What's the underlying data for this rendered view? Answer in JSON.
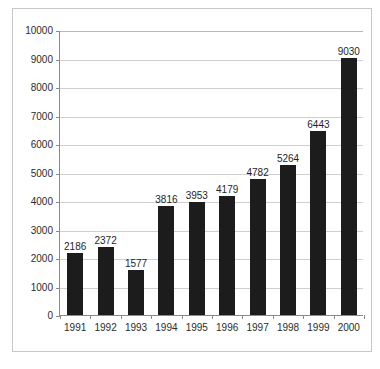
{
  "chart_data": {
    "type": "bar",
    "title": "",
    "subtitle": "",
    "xlabel": "",
    "ylabel": "",
    "categories": [
      "1991",
      "1992",
      "1993",
      "1994",
      "1995",
      "1996",
      "1997",
      "1998",
      "1999",
      "2000"
    ],
    "values": [
      2186,
      2372,
      1577,
      3816,
      3953,
      4179,
      4782,
      5264,
      6443,
      9030
    ],
    "data_labels": [
      "2186",
      "2372",
      "1577",
      "3816",
      "3953",
      "4179",
      "4782",
      "5264",
      "6443",
      "9030"
    ],
    "ylim": [
      0,
      10000
    ],
    "ytick_values": [
      0,
      1000,
      2000,
      3000,
      4000,
      5000,
      6000,
      7000,
      8000,
      9000,
      10000
    ],
    "ytick_labels": [
      "0",
      "1000",
      "2000",
      "3000",
      "4000",
      "5000",
      "6000",
      "7000",
      "8000",
      "9000",
      "10000"
    ],
    "grid": true,
    "grid_axis": "y",
    "legend": false,
    "legend_position": "none",
    "series": [
      {
        "name": "",
        "values": [
          2186,
          2372,
          1577,
          3816,
          3953,
          4179,
          4782,
          5264,
          6443,
          9030
        ]
      }
    ],
    "colors": {
      "bar": "#1c1c1c",
      "gridline": "#cfcfcf",
      "axis": "#8a8a8a",
      "frame": "#c9c9c9",
      "text": "#2b2b2b",
      "background": "#ffffff"
    }
  }
}
